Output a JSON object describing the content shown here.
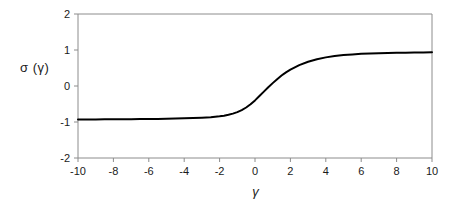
{
  "chart_data": {
    "type": "line",
    "title": "",
    "xlabel": "γ",
    "ylabel": "σ (γ)",
    "xlim": [
      -10,
      10
    ],
    "ylim": [
      -2,
      2
    ],
    "xticks": [
      -10,
      -8,
      -6,
      -4,
      -2,
      0,
      2,
      4,
      6,
      8,
      10
    ],
    "xtick_labels": [
      "-10",
      "-8",
      "-6",
      "-4",
      "-2",
      "0",
      "2",
      "4",
      "6",
      "8",
      "10"
    ],
    "yticks": [
      2,
      1,
      0,
      -1,
      -2
    ],
    "ytick_labels": [
      "2",
      "1",
      "0",
      "-1",
      "-2"
    ],
    "grid": false,
    "legend": null,
    "series": [
      {
        "name": "sigma(gamma)",
        "color": "#000000",
        "x": [
          -10,
          -9.5,
          -9,
          -8.5,
          -8,
          -7.5,
          -7,
          -6.5,
          -6,
          -5.5,
          -5,
          -4.5,
          -4,
          -3.5,
          -3,
          -2.5,
          -2,
          -1.75,
          -1.5,
          -1.25,
          -1,
          -0.75,
          -0.5,
          -0.25,
          0,
          0.25,
          0.5,
          0.75,
          1,
          1.25,
          1.5,
          1.75,
          2,
          2.5,
          3,
          3.5,
          4,
          4.5,
          5,
          5.5,
          6,
          6.5,
          7,
          7.5,
          8,
          8.5,
          9,
          9.5,
          10
        ],
        "y": [
          -0.93,
          -0.929,
          -0.928,
          -0.927,
          -0.925,
          -0.924,
          -0.922,
          -0.92,
          -0.917,
          -0.914,
          -0.91,
          -0.905,
          -0.899,
          -0.891,
          -0.88,
          -0.865,
          -0.841,
          -0.824,
          -0.8,
          -0.768,
          -0.725,
          -0.669,
          -0.597,
          -0.508,
          -0.4,
          -0.28,
          -0.155,
          -0.034,
          0.08,
          0.19,
          0.29,
          0.38,
          0.455,
          0.58,
          0.675,
          0.745,
          0.795,
          0.832,
          0.859,
          0.878,
          0.893,
          0.904,
          0.912,
          0.918,
          0.923,
          0.927,
          0.93,
          0.933,
          0.935
        ]
      }
    ],
    "annotations": []
  },
  "axes": {
    "frame_color": "#8c8c8c",
    "curve_color": "#000000",
    "background": "#ffffff"
  }
}
